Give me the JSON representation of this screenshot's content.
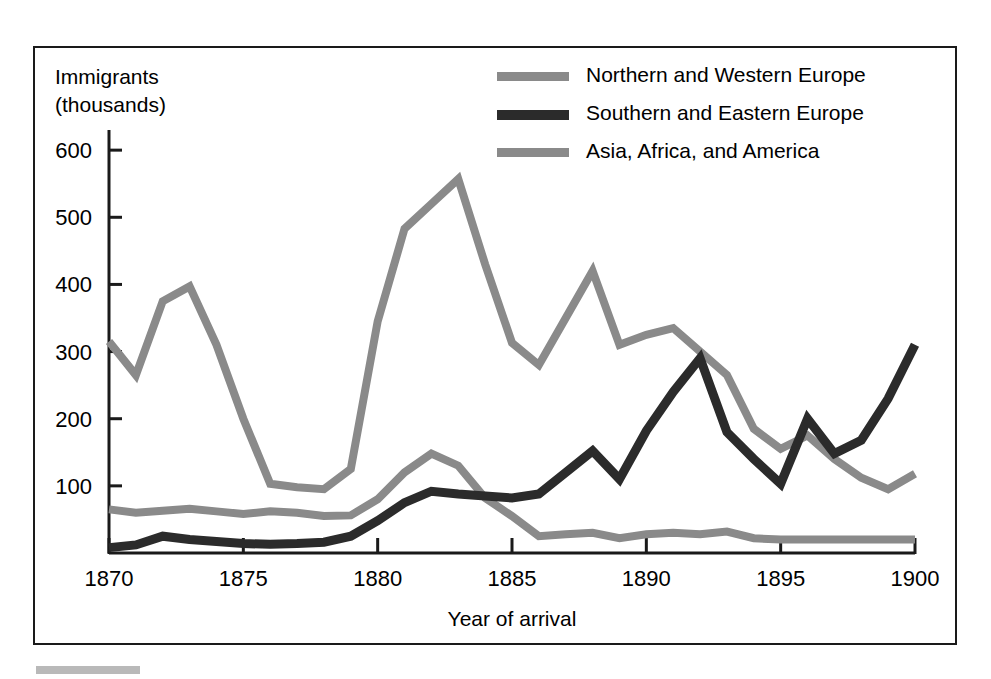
{
  "figure": {
    "frame_border_color": "#1a1a1a",
    "background_color": "#ffffff",
    "footer_bar_color": "#b9b9b9"
  },
  "axes": {
    "y_axis_title_line1": "Immigrants",
    "y_axis_title_line2": "(thousands)",
    "x_axis_title": "Year of arrival",
    "y_ticks": [
      "100",
      "200",
      "300",
      "400",
      "500",
      "600"
    ],
    "x_ticks": [
      "1870",
      "1875",
      "1880",
      "1885",
      "1890",
      "1895",
      "1900"
    ]
  },
  "legend": {
    "position": "top-center-right",
    "entries": [
      {
        "label": "Northern and Western Europe",
        "color": "#8a8a8a"
      },
      {
        "label": "Southern and Eastern Europe",
        "color": "#2b2b2b"
      },
      {
        "label": "Asia, Africa, and America",
        "color": "#8a8a8a"
      }
    ]
  },
  "chart_data": {
    "type": "line",
    "title": "",
    "subtitle": "",
    "xlabel": "Year of arrival",
    "ylabel": "Immigrants (thousands)",
    "xlim": [
      1870,
      1900
    ],
    "ylim": [
      0,
      630
    ],
    "grid": false,
    "legend_position": "top-center-right",
    "xticks": [
      1870,
      1875,
      1880,
      1885,
      1890,
      1895,
      1900
    ],
    "yticks": [
      100,
      200,
      300,
      400,
      500,
      600
    ],
    "x": [
      1870,
      1871,
      1872,
      1873,
      1874,
      1875,
      1876,
      1877,
      1878,
      1879,
      1880,
      1881,
      1882,
      1883,
      1884,
      1885,
      1886,
      1887,
      1888,
      1889,
      1890,
      1891,
      1892,
      1893,
      1894,
      1895,
      1896,
      1897,
      1898,
      1899,
      1900
    ],
    "series": [
      {
        "name": "Northern and Western Europe",
        "color": "#8a8a8a",
        "values": [
          315,
          265,
          375,
          397,
          310,
          200,
          103,
          98,
          95,
          125,
          345,
          483,
          520,
          557,
          430,
          313,
          280,
          350,
          420,
          310,
          325,
          335,
          300,
          265,
          185,
          155,
          175,
          140,
          112,
          95,
          118
        ]
      },
      {
        "name": "Southern and Eastern Europe",
        "color": "#2b2b2b",
        "values": [
          8,
          12,
          25,
          20,
          17,
          14,
          13,
          14,
          16,
          25,
          48,
          75,
          92,
          88,
          85,
          82,
          88,
          120,
          152,
          110,
          182,
          240,
          290,
          180,
          140,
          103,
          200,
          148,
          168,
          230,
          310
        ]
      },
      {
        "name": "Asia, Africa, and America",
        "color": "#8a8a8a",
        "values": [
          65,
          60,
          63,
          66,
          62,
          58,
          62,
          60,
          55,
          56,
          80,
          120,
          148,
          130,
          82,
          55,
          25,
          28,
          30,
          22,
          28,
          30,
          28,
          32,
          22,
          20,
          20,
          20,
          20,
          20,
          20
        ]
      }
    ]
  }
}
